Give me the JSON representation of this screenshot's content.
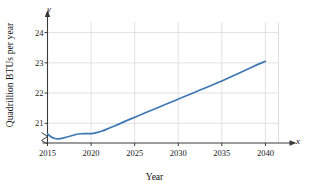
{
  "chart_data": {
    "type": "line",
    "title": "",
    "xlabel": "Year",
    "ylabel": "Quadrillion BTUs per year",
    "xlim": [
      2015,
      2041.5
    ],
    "ylim": [
      20.35,
      24.35
    ],
    "grid": true,
    "legend": false,
    "axis_break_y": true,
    "x_var_symbol": "x",
    "y_var_symbol": "y",
    "line_color": "#3d78b4",
    "grid_color": "#d6d6d6",
    "axis_color": "#3a3a3a",
    "xticks": [
      2015,
      2020,
      2025,
      2030,
      2035,
      2040
    ],
    "xtick_labels": [
      "2015",
      "2020",
      "2025",
      "2030",
      "2035",
      "2040"
    ],
    "yticks": [
      21,
      22,
      23,
      24
    ],
    "ytick_labels": [
      "21",
      "22",
      "23",
      "24"
    ],
    "series": [
      {
        "name": "Energy consumption",
        "x": [
          2015,
          2015.5,
          2016,
          2016.5,
          2017,
          2017.5,
          2018,
          2018.5,
          2019,
          2019.5,
          2020,
          2020.5,
          2021,
          2021.5,
          2022,
          2022.5,
          2023,
          2024,
          2025,
          2026,
          2027,
          2028,
          2029,
          2030,
          2031,
          2032,
          2033,
          2034,
          2035,
          2036,
          2037,
          2038,
          2039,
          2040
        ],
        "values": [
          20.65,
          20.53,
          20.48,
          20.49,
          20.53,
          20.57,
          20.61,
          20.65,
          20.66,
          20.66,
          20.66,
          20.68,
          20.72,
          20.77,
          20.83,
          20.89,
          20.95,
          21.08,
          21.2,
          21.32,
          21.44,
          21.56,
          21.68,
          21.8,
          21.92,
          22.04,
          22.16,
          22.28,
          22.4,
          22.53,
          22.66,
          22.8,
          22.93,
          23.05
        ]
      }
    ]
  }
}
